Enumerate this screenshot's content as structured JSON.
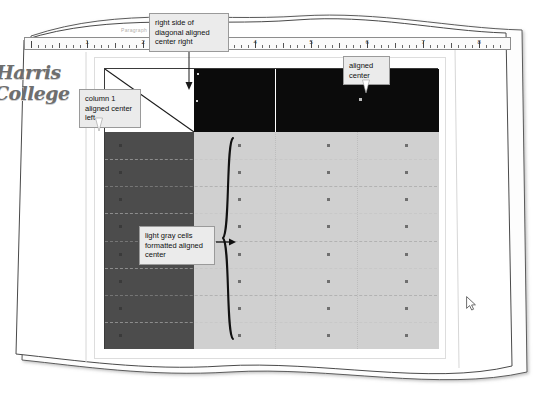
{
  "document": {
    "type": "word-processor-table-illustration",
    "logo": {
      "line1": "Harris",
      "line2": "College"
    },
    "ribbon_label": "Paragraph"
  },
  "ruler": {
    "numbers": [
      "1",
      "2",
      "3",
      "4",
      "5",
      "6",
      "7",
      "8"
    ],
    "unit": "inches",
    "tick_count": 96
  },
  "callouts": [
    {
      "id": "diagonal",
      "text": "right side of diagonal aligned center right",
      "points_to": "header-row-column-2"
    },
    {
      "id": "column1",
      "text": "column 1 aligned center left",
      "points_to": "body-column-1"
    },
    {
      "id": "center",
      "text": "aligned center",
      "points_to": "header-row-column-3"
    },
    {
      "id": "light-gray",
      "text": "light gray cells formatted aligned center",
      "points_to": "light-gray-cell-block"
    }
  ],
  "table": {
    "header": {
      "cells": [
        {
          "name": "diagonal-cell",
          "fill": "#ffffff",
          "has_diagonal": true
        },
        {
          "name": "header-cell-2",
          "fill": "#0b0b0b"
        },
        {
          "name": "header-cell-3",
          "fill": "#0b0b0b"
        }
      ]
    },
    "body": {
      "row_count": 8,
      "columns": [
        {
          "name": "column-1",
          "fill": "#4c4c4c",
          "alignment": "center left"
        },
        {
          "name": "column-2",
          "fill": "#d0d0d0",
          "alignment": "center"
        },
        {
          "name": "column-3",
          "fill": "#d0d0d0",
          "alignment": "center"
        },
        {
          "name": "column-4",
          "fill": "#d0d0d0",
          "alignment": "center"
        }
      ]
    }
  },
  "colors": {
    "header_black": "#0b0b0b",
    "column1_dark_gray": "#4c4c4c",
    "light_gray_cells": "#d0d0d0",
    "callout_bg": "#ebebeb",
    "callout_border": "#9a9a9a",
    "table_border": "#3a3a3a",
    "logo_gray": "#6e6e6e"
  },
  "cursor": {
    "name": "mouse-pointer",
    "x": 466,
    "y": 296
  }
}
